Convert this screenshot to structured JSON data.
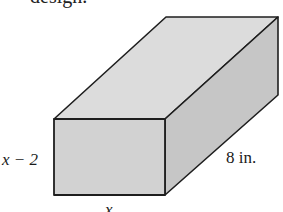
{
  "caption_fragment": "design.",
  "figure": {
    "type": "rectangular-prism",
    "colors": {
      "top_face": "#dcdcdc",
      "front_face": "#d2d2d2",
      "side_face": "#c6c6c6",
      "edge": "#1e1e1e"
    },
    "labels": {
      "height": "x − 2",
      "depth": "8 in.",
      "width": "x"
    }
  }
}
